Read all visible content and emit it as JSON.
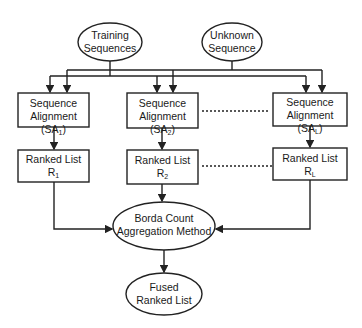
{
  "diagram": {
    "inputs": [
      {
        "id": "training",
        "line1": "Training",
        "line2": "Sequences"
      },
      {
        "id": "unknown",
        "line1": "Unknown",
        "line2": "Sequence"
      }
    ],
    "alignments": [
      {
        "line1": "Sequence",
        "line2": "Alignment (SA",
        "sub": "1",
        "close": ")"
      },
      {
        "line1": "Sequence",
        "line2": "Alignment (SA",
        "sub": "2",
        "close": ")"
      },
      {
        "line1": "Sequence",
        "line2": "Alignment (SA",
        "sub": "L",
        "close": ")"
      }
    ],
    "ranked_lists": [
      {
        "line1": "Ranked List",
        "line2": "R",
        "sub": "1"
      },
      {
        "line1": "Ranked List",
        "line2": "R",
        "sub": "2"
      },
      {
        "line1": "Ranked List",
        "line2": "R",
        "sub": "L"
      }
    ],
    "aggregator": {
      "line1": "Borda Count",
      "line2": "Aggregation Method"
    },
    "output": {
      "line1": "Fused",
      "line2": "Ranked List"
    },
    "colors": {
      "stroke": "#222222",
      "background": "#ffffff"
    }
  }
}
